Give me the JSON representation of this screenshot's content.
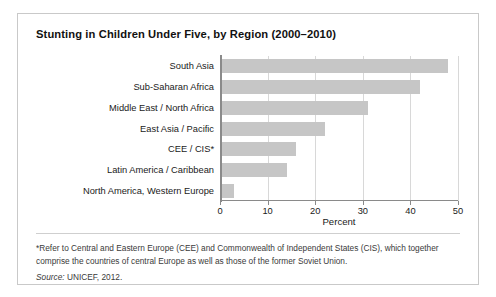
{
  "figure": {
    "title": "Stunting in Children Under Five, by Region (2000–2010)",
    "footnote": "*Refer to Central and Eastern Europe (CEE) and Commonwealth of Independent States (CIS), which together comprise the countries of central Europe as well as those of the former Soviet Union.",
    "source_prefix": "Source:",
    "source_text": "UNICEF, 2012.",
    "bar_color": "#c6c6c6",
    "grid_color": "#d8d8d8",
    "axis_color": "#8a8a8a",
    "border_color": "#c9c9c9"
  },
  "chart_data": {
    "type": "bar",
    "orientation": "horizontal",
    "title": "Stunting in Children Under Five, by Region (2000–2010)",
    "xlabel": "Percent",
    "ylabel": "",
    "xlim": [
      0,
      50
    ],
    "xticks": [
      0,
      10,
      20,
      30,
      40,
      50
    ],
    "xtick_labels": [
      "0",
      "10",
      "20",
      "30",
      "40",
      "50"
    ],
    "grid": "vertical",
    "legend": "none",
    "categories": [
      "South Asia",
      "Sub-Saharan Africa",
      "Middle East / North Africa",
      "East Asia / Pacific",
      "CEE / CIS*",
      "Latin America / Caribbean",
      "North America, Western Europe"
    ],
    "values": [
      48,
      42,
      31,
      22,
      16,
      14,
      3
    ]
  }
}
